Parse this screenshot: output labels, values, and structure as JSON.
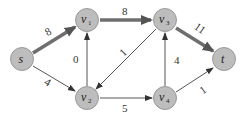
{
  "diagram": {
    "type": "flow-network",
    "nodes": [
      {
        "id": "s",
        "label": "s",
        "sub": "",
        "x": 22,
        "y": 59
      },
      {
        "id": "v1",
        "label": "v",
        "sub": "1",
        "x": 87,
        "y": 20
      },
      {
        "id": "v3",
        "label": "v",
        "sub": "3",
        "x": 165,
        "y": 20
      },
      {
        "id": "t",
        "label": "t",
        "sub": "",
        "x": 224,
        "y": 59
      },
      {
        "id": "v2",
        "label": "v",
        "sub": "2",
        "x": 87,
        "y": 98
      },
      {
        "id": "v4",
        "label": "v",
        "sub": "4",
        "x": 165,
        "y": 98
      }
    ],
    "edges": [
      {
        "from": "s",
        "to": "v1",
        "label": "8",
        "thick": true
      },
      {
        "from": "v1",
        "to": "v3",
        "label": "8",
        "thick": true
      },
      {
        "from": "v3",
        "to": "t",
        "label": "11",
        "thick": true
      },
      {
        "from": "s",
        "to": "v2",
        "label": "4",
        "thick": false
      },
      {
        "from": "v2",
        "to": "v1",
        "label": "0",
        "thick": false
      },
      {
        "from": "v3",
        "to": "v2",
        "label": "1",
        "thick": false
      },
      {
        "from": "v2",
        "to": "v4",
        "label": "5",
        "thick": false
      },
      {
        "from": "v4",
        "to": "v3",
        "label": "4",
        "thick": false
      },
      {
        "from": "v4",
        "to": "t",
        "label": "1",
        "thick": false
      }
    ],
    "colors": {
      "node_fill": "#bdbdbd",
      "node_stroke": "#8a8a8a",
      "edge": "#6a6a6a",
      "thick_edge": "#6e6e6e"
    }
  }
}
